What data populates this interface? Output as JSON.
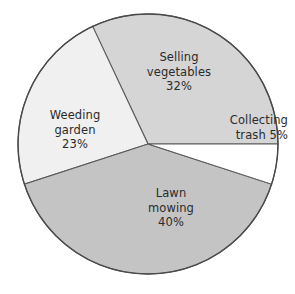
{
  "chart_data": {
    "type": "pie",
    "title": "",
    "subtitle": "",
    "xlabel": "",
    "ylabel": "",
    "grid": false,
    "legend_position": "none",
    "labels_inline": true,
    "unit": "%",
    "total": 100,
    "start_angle_deg": 0,
    "direction": "clockwise",
    "center": [
      148,
      144
    ],
    "radius": 130,
    "categories": [
      "Collecting trash",
      "Lawn mowing",
      "Weeding garden",
      "Selling vegetables"
    ],
    "values": [
      5,
      40,
      23,
      32
    ],
    "slices": [
      {
        "name": "Collecting trash",
        "value": 5,
        "percent_text": "5%",
        "color": "#ffffff",
        "start_deg": 0,
        "end_deg": 18,
        "label_lines": [
          "Collecting",
          "trash 5%"
        ]
      },
      {
        "name": "Lawn mowing",
        "value": 40,
        "percent_text": "40%",
        "color": "#c4c4c4",
        "start_deg": 18,
        "end_deg": 162,
        "label_lines": [
          "Lawn",
          "mowing",
          "40%"
        ]
      },
      {
        "name": "Weeding garden",
        "value": 23,
        "percent_text": "23%",
        "color": "#f0f0f0",
        "start_deg": 162,
        "end_deg": 244.8,
        "label_lines": [
          "Weeding",
          "garden",
          "23%"
        ]
      },
      {
        "name": "Selling vegetables",
        "value": 32,
        "percent_text": "32%",
        "color": "#d5d5d5",
        "start_deg": 244.8,
        "end_deg": 360,
        "label_lines": [
          "Selling",
          "vegetables",
          "32%"
        ]
      }
    ]
  },
  "labels": {
    "selling_vegetables": {
      "line1": "Selling",
      "line2": "vegetables",
      "line3": "32%"
    },
    "collecting_trash": {
      "line1": "Collecting",
      "line2": "trash 5%"
    },
    "weeding_garden": {
      "line1": "Weeding",
      "line2": "garden",
      "line3": "23%"
    },
    "lawn_mowing": {
      "line1": "Lawn",
      "line2": "mowing",
      "line3": "40%"
    }
  },
  "style": {
    "background": "#ffffff",
    "outline": "#4a4a4a",
    "text_color": "#2b2b2b"
  }
}
